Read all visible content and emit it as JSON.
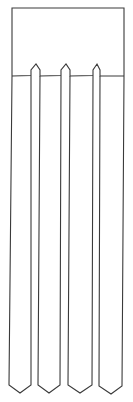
{
  "figure": {
    "stroke_color": "#3a3a3a",
    "background": "#ffffff",
    "header_box": {
      "x1": 12,
      "y1": 8,
      "x2": 124,
      "baseline_y": 76
    },
    "strip_count": 4,
    "strips": [
      {
        "name": "strip-1",
        "left_top": 12,
        "right_top": 31,
        "left_bottom": 9,
        "right_bottom": 31,
        "tip_x": 20,
        "tip_y": 393
      },
      {
        "name": "strip-2",
        "left_top": 40,
        "right_top": 61,
        "left_bottom": 38,
        "right_bottom": 60,
        "tip_x": 49,
        "tip_y": 393
      },
      {
        "name": "strip-3",
        "left_top": 70,
        "right_top": 93,
        "left_bottom": 68,
        "right_bottom": 92,
        "tip_x": 80,
        "tip_y": 393
      },
      {
        "name": "strip-4",
        "left_top": 100,
        "right_top": 124,
        "left_bottom": 99,
        "right_bottom": 122,
        "tip_x": 111,
        "tip_y": 394
      }
    ],
    "gap_tips": [
      {
        "name": "gap-tip-1",
        "left": 31,
        "right": 40,
        "apex_x": 36,
        "apex_y": 64,
        "shoulder_y": 70
      },
      {
        "name": "gap-tip-2",
        "left": 61,
        "right": 70,
        "apex_x": 66,
        "apex_y": 64,
        "shoulder_y": 70
      },
      {
        "name": "gap-tip-3",
        "left": 93,
        "right": 100,
        "apex_x": 97,
        "apex_y": 64,
        "shoulder_y": 70
      }
    ]
  }
}
